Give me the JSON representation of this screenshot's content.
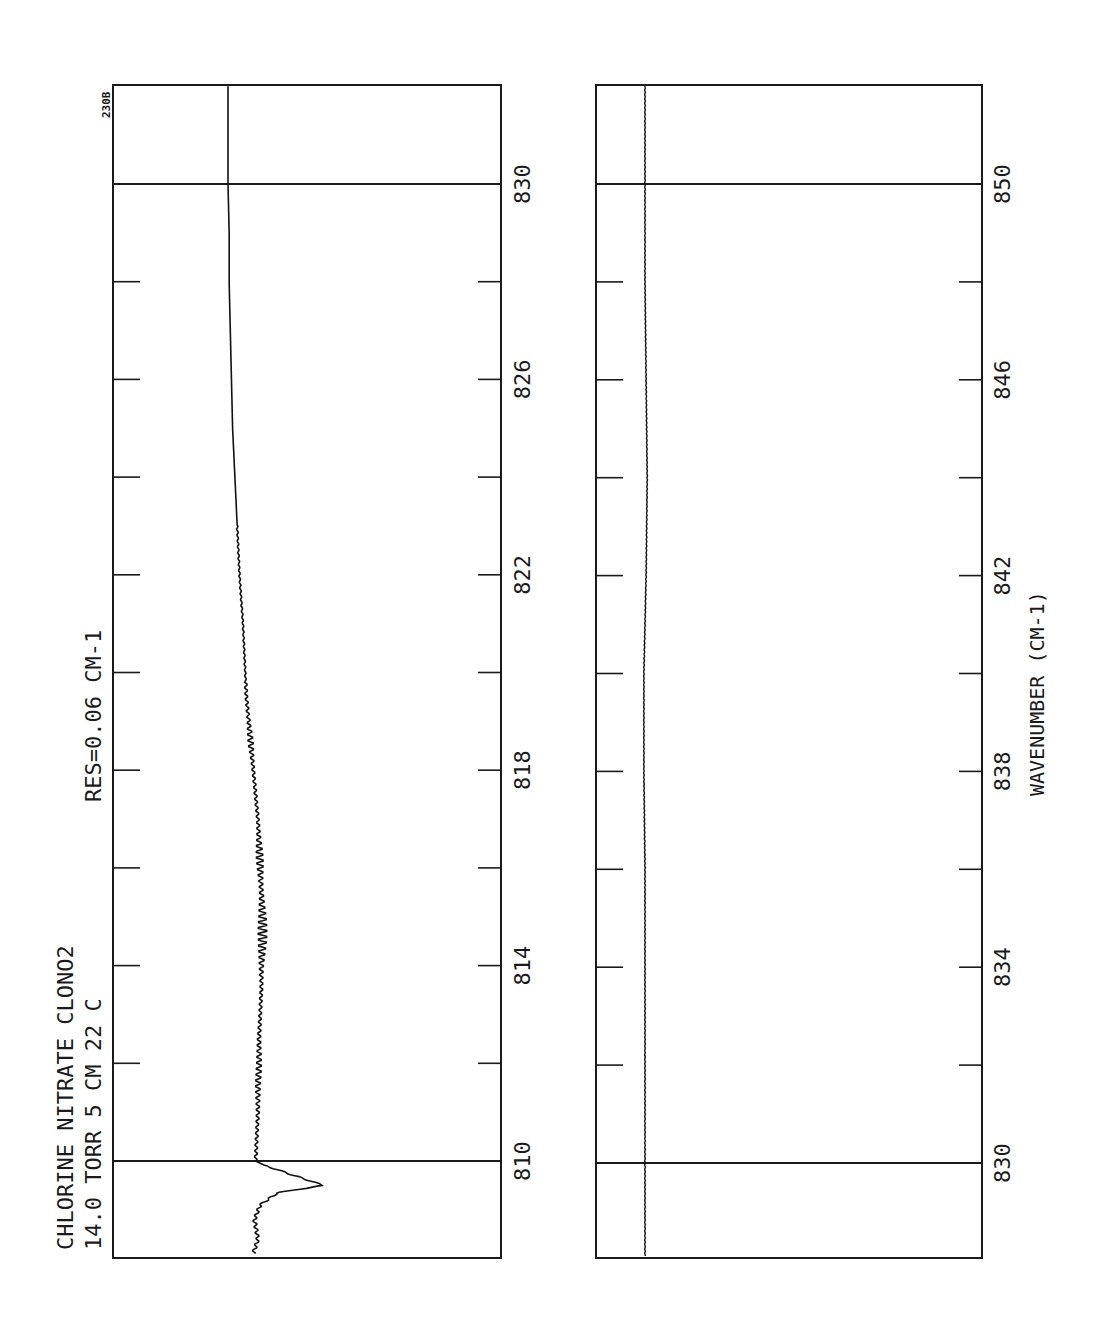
{
  "page": {
    "plate_id": "230B",
    "title_line1": "CHLORINE NITRATE  CLONO2",
    "title_line2": "14.0 TORR  5 CM  22 C",
    "resolution": "RES=0.06 CM-1",
    "xlabel": "WAVENUMBER (CM-1)"
  },
  "panels": [
    {
      "name": "left-panel",
      "range": [
        808,
        832
      ],
      "tick_labels": [
        "810",
        "814",
        "818",
        "822",
        "826",
        "830"
      ]
    },
    {
      "name": "right-panel",
      "range": [
        828,
        852
      ],
      "tick_labels": [
        "830",
        "834",
        "838",
        "842",
        "846",
        "850"
      ]
    }
  ],
  "chart_data": [
    {
      "type": "line",
      "title": "CHLORINE NITRATE CLONO2 — 14.0 TORR, 5 CM, 22 C, RES=0.06 CM-1",
      "xlabel": "WAVENUMBER (CM-1)",
      "ylabel": "Absorbance (relative, unlabeled)",
      "xlim": [
        808,
        832
      ],
      "x_ticks_major": [
        810,
        814,
        818,
        822,
        826,
        830
      ],
      "x_ticks_minor": [
        812,
        816,
        820,
        824,
        828
      ],
      "grid": "vertical reference lines at 810 and 830",
      "series": [
        {
          "name": "CLONO2 spectrum 808-832",
          "x": [
            808.1,
            808.4,
            808.8,
            809.1,
            809.35,
            809.5,
            809.7,
            809.9,
            810.0,
            810.5,
            811.0,
            811.5,
            812.0,
            812.5,
            813.0,
            813.5,
            814.0,
            814.5,
            815.0,
            815.5,
            816.0,
            816.5,
            817.0,
            817.5,
            818.0,
            818.5,
            819.0,
            819.5,
            820.0,
            821.0,
            822.0,
            823.0,
            824.0,
            825.0,
            826.0,
            827.0,
            828.0,
            829.0,
            830.0,
            831.0,
            832.0
          ],
          "y": [
            0.24,
            0.28,
            0.25,
            0.3,
            0.45,
            0.85,
            0.6,
            0.35,
            0.26,
            0.27,
            0.28,
            0.28,
            0.29,
            0.29,
            0.3,
            0.31,
            0.31,
            0.32,
            0.32,
            0.31,
            0.3,
            0.29,
            0.28,
            0.26,
            0.24,
            0.22,
            0.2,
            0.18,
            0.17,
            0.15,
            0.12,
            0.1,
            0.08,
            0.06,
            0.05,
            0.04,
            0.03,
            0.03,
            0.02,
            0.02,
            0.02
          ],
          "notes": "Strong peak near 809.3 cm-1; rotational fine-structure oscillations between 810 and 819 cm-1, largest near 814.5-815 cm-1"
        }
      ]
    },
    {
      "type": "line",
      "title": "CHLORINE NITRATE CLONO2 (continued)",
      "xlabel": "WAVENUMBER (CM-1)",
      "ylabel": "Absorbance (relative, unlabeled)",
      "xlim": [
        828,
        852
      ],
      "x_ticks_major": [
        830,
        834,
        838,
        842,
        846,
        850
      ],
      "x_ticks_minor": [
        832,
        836,
        840,
        844,
        848
      ],
      "grid": "vertical reference lines at 830 and 850",
      "series": [
        {
          "name": "CLONO2 spectrum 828-852",
          "x": [
            828,
            830,
            832,
            834,
            836,
            838,
            840,
            842,
            844,
            846,
            848,
            850,
            852
          ],
          "y": [
            0.02,
            0.02,
            0.02,
            0.02,
            0.02,
            0.01,
            0.01,
            0.03,
            0.04,
            0.03,
            0.02,
            0.02,
            0.02
          ],
          "notes": "Essentially flat baseline with a slight broad bump around 842-846 cm-1"
        }
      ]
    }
  ]
}
